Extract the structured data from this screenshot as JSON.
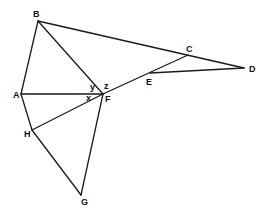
{
  "figure": {
    "type": "geometry-diagram",
    "stroke_color": "#1a1a1a",
    "background": "#ffffff"
  },
  "points": {
    "A": {
      "label": "A",
      "x": 21,
      "y": 94,
      "lx": 13,
      "ly": 98
    },
    "B": {
      "label": "B",
      "x": 38,
      "y": 21,
      "lx": 33,
      "ly": 17
    },
    "C": {
      "label": "C",
      "x": 188,
      "y": 55,
      "lx": 186,
      "ly": 52
    },
    "D": {
      "label": "D",
      "x": 244,
      "y": 68,
      "lx": 249,
      "ly": 72
    },
    "E": {
      "label": "E",
      "x": 150,
      "y": 73,
      "lx": 146,
      "ly": 85
    },
    "F": {
      "label": "F",
      "x": 103,
      "y": 94,
      "lx": 105,
      "ly": 102
    },
    "G": {
      "label": "G",
      "x": 81,
      "y": 195,
      "lx": 81,
      "ly": 205
    },
    "H": {
      "label": "H",
      "x": 32,
      "y": 130,
      "lx": 24,
      "ly": 137
    }
  },
  "segments": [
    {
      "from": "A",
      "to": "B"
    },
    {
      "from": "B",
      "to": "D"
    },
    {
      "from": "B",
      "to": "F"
    },
    {
      "from": "A",
      "to": "F"
    },
    {
      "from": "A",
      "to": "H"
    },
    {
      "from": "H",
      "to": "F"
    },
    {
      "from": "H",
      "to": "G"
    },
    {
      "from": "G",
      "to": "F"
    },
    {
      "from": "F",
      "to": "C"
    },
    {
      "from": "E",
      "to": "D"
    }
  ],
  "angles": {
    "x": {
      "label": "x",
      "x": 86,
      "y": 101
    },
    "y": {
      "label": "y",
      "x": 90,
      "y": 90
    },
    "z": {
      "label": "z",
      "x": 104,
      "y": 89
    }
  }
}
